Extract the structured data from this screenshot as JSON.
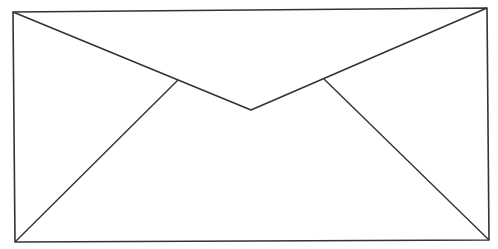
{
  "figure": {
    "stroke_color": "#333333",
    "background_color": "#ffffff",
    "body": {
      "tl": [
        13,
        12
      ],
      "tr": [
        487,
        8
      ],
      "br": [
        489,
        240
      ],
      "bl": [
        15,
        242
      ]
    },
    "flap": {
      "left": [
        13,
        12
      ],
      "apex": [
        251,
        110
      ],
      "right": [
        487,
        8
      ]
    },
    "inner_left": {
      "from": [
        178,
        80
      ],
      "to": [
        15,
        242
      ]
    },
    "inner_right": {
      "from": [
        324,
        79
      ],
      "to": [
        489,
        240
      ]
    }
  }
}
